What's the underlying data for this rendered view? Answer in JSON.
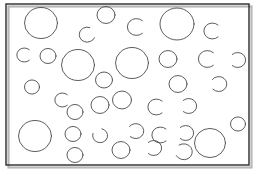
{
  "figure": {
    "kind": "circle-field-puzzle",
    "title": "",
    "caption": "",
    "width": 261,
    "height": 176,
    "background_color": "#ffffff",
    "frame": {
      "name": "outer-frame",
      "x": 6,
      "y": 4,
      "width": 243,
      "height": 161,
      "stroke_color": "#2b2b2b",
      "stroke_width": 1.4,
      "fill": "none",
      "shadow_color": "#b8b8b8"
    },
    "ink_color": "#4a4a52",
    "stroke_width": 0.9,
    "counts": {
      "closed_circles": 22,
      "open_arcs": 20,
      "total_shapes": 42
    },
    "shapes": [
      {
        "id": "c01",
        "type": "circle",
        "cx": 41,
        "cy": 23,
        "r": 16.5
      },
      {
        "id": "c02",
        "type": "circle",
        "cx": 106,
        "cy": 15,
        "r": 9
      },
      {
        "id": "c03",
        "type": "circle",
        "cx": 177,
        "cy": 24,
        "r": 17
      },
      {
        "id": "a04",
        "type": "arc",
        "cx": 87,
        "cy": 35,
        "r": 8,
        "gap_start": -70,
        "gap_end": 20
      },
      {
        "id": "a05",
        "type": "arc",
        "cx": 136,
        "cy": 27,
        "r": 9,
        "gap_start": -45,
        "gap_end": 45
      },
      {
        "id": "a06",
        "type": "arc",
        "cx": 212,
        "cy": 31,
        "r": 8.5,
        "gap_start": -45,
        "gap_end": 45
      },
      {
        "id": "a07",
        "type": "arc",
        "cx": 24,
        "cy": 55,
        "r": 7.5,
        "gap_start": -45,
        "gap_end": 45
      },
      {
        "id": "c08",
        "type": "circle",
        "cx": 48,
        "cy": 56,
        "r": 8
      },
      {
        "id": "c09",
        "type": "circle",
        "cx": 78,
        "cy": 65,
        "r": 16.5
      },
      {
        "id": "c10",
        "type": "circle",
        "cx": 132,
        "cy": 63,
        "r": 16.5
      },
      {
        "id": "c11",
        "type": "circle",
        "cx": 168,
        "cy": 59,
        "r": 9
      },
      {
        "id": "a12",
        "type": "arc",
        "cx": 207,
        "cy": 59,
        "r": 9,
        "gap_start": -45,
        "gap_end": 45
      },
      {
        "id": "a13",
        "type": "arc",
        "cx": 238,
        "cy": 60,
        "r": 8,
        "gap_start": 135,
        "gap_end": 225
      },
      {
        "id": "c14",
        "type": "circle",
        "cx": 104,
        "cy": 80,
        "r": 8.5
      },
      {
        "id": "c15",
        "type": "circle",
        "cx": 178,
        "cy": 84,
        "r": 9
      },
      {
        "id": "a16",
        "type": "arc",
        "cx": 219,
        "cy": 84,
        "r": 8,
        "gap_start": 140,
        "gap_end": 215
      },
      {
        "id": "c17",
        "type": "circle",
        "cx": 32,
        "cy": 87,
        "r": 7.5
      },
      {
        "id": "a18",
        "type": "arc",
        "cx": 62,
        "cy": 100,
        "r": 7.5,
        "gap_start": -45,
        "gap_end": 45
      },
      {
        "id": "c19",
        "type": "circle",
        "cx": 100,
        "cy": 105,
        "r": 9
      },
      {
        "id": "c20",
        "type": "circle",
        "cx": 122,
        "cy": 100,
        "r": 9.5
      },
      {
        "id": "a21",
        "type": "arc",
        "cx": 156,
        "cy": 107,
        "r": 8.5,
        "gap_start": -45,
        "gap_end": 45
      },
      {
        "id": "a22",
        "type": "arc",
        "cx": 189,
        "cy": 106,
        "r": 8,
        "gap_start": 135,
        "gap_end": 225
      },
      {
        "id": "c23",
        "type": "circle",
        "cx": 75,
        "cy": 112,
        "r": 8
      },
      {
        "id": "c24",
        "type": "circle",
        "cx": 35,
        "cy": 136,
        "r": 16.5
      },
      {
        "id": "c25",
        "type": "circle",
        "cx": 73,
        "cy": 134,
        "r": 8
      },
      {
        "id": "a26",
        "type": "arc",
        "cx": 100,
        "cy": 136,
        "r": 7.5,
        "gap_start": 200,
        "gap_end": 285
      },
      {
        "id": "a27",
        "type": "arc",
        "cx": 136,
        "cy": 131,
        "r": 8,
        "gap_start": 135,
        "gap_end": 215
      },
      {
        "id": "a28",
        "type": "arc",
        "cx": 160,
        "cy": 135,
        "r": 8.5,
        "gap_start": -45,
        "gap_end": 45
      },
      {
        "id": "a29",
        "type": "arc",
        "cx": 186,
        "cy": 133,
        "r": 8,
        "gap_start": 135,
        "gap_end": 225
      },
      {
        "id": "c30",
        "type": "circle",
        "cx": 210,
        "cy": 143,
        "r": 15.5
      },
      {
        "id": "c31",
        "type": "circle",
        "cx": 238,
        "cy": 124,
        "r": 7.5
      },
      {
        "id": "c32",
        "type": "circle",
        "cx": 75,
        "cy": 155,
        "r": 8
      },
      {
        "id": "c33",
        "type": "circle",
        "cx": 121,
        "cy": 150,
        "r": 9
      },
      {
        "id": "a34",
        "type": "arc",
        "cx": 154,
        "cy": 148,
        "r": 8,
        "gap_start": 135,
        "gap_end": 225
      },
      {
        "id": "a35",
        "type": "arc",
        "cx": 184,
        "cy": 152,
        "r": 8.5,
        "gap_start": 155,
        "gap_end": 235
      },
      {
        "id": "a36",
        "type": "arc",
        "cx": 96,
        "cy": 152,
        "r": 0.1
      },
      {
        "id": "c37",
        "type": "circle",
        "cx": 153,
        "cy": 86,
        "r": 0.1
      },
      {
        "id": "a38",
        "type": "arc",
        "cx": 61,
        "cy": 127,
        "r": 0.1
      },
      {
        "id": "c39",
        "type": "circle",
        "cx": 33,
        "cy": 39,
        "r": 0.1
      },
      {
        "id": "a40",
        "type": "arc",
        "cx": 201,
        "cy": 121,
        "r": 0.1
      },
      {
        "id": "c41",
        "type": "circle",
        "cx": 145,
        "cy": 45,
        "r": 0.1
      },
      {
        "id": "a42",
        "type": "arc",
        "cx": 229,
        "cy": 95,
        "r": 0.1
      }
    ]
  }
}
